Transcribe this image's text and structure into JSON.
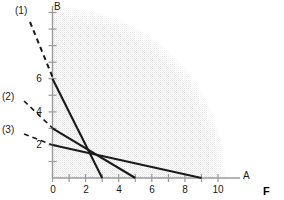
{
  "figure": {
    "title": "",
    "axis_labels": {
      "x": "A",
      "y": "B",
      "corner": "F"
    },
    "origin_px": {
      "x": 52.5,
      "y": 178
    },
    "unit_px": 16.55,
    "axes": {
      "x": {
        "ticks": [
          0,
          1,
          2,
          3,
          4,
          5,
          6,
          7,
          8,
          9,
          10
        ],
        "labeled": [
          0,
          2,
          4,
          6,
          8,
          10
        ],
        "max": 11.2
      },
      "y": {
        "ticks": [
          1,
          2,
          3,
          4,
          5,
          6,
          7,
          8,
          9,
          10
        ],
        "labeled": [
          2,
          4,
          6
        ],
        "max": 10.6
      }
    },
    "lines": [
      {
        "name": "(1)",
        "label": "(1)",
        "y_intercept": 6,
        "x_intercept": 3,
        "label_pos": {
          "x": 22,
          "y": 8
        },
        "leader": {
          "x1": 30,
          "y1": 22,
          "x2": 52,
          "y2": 77
        }
      },
      {
        "name": "(2)",
        "label": "(2)",
        "y_intercept": 3,
        "x_intercept": 5,
        "label_pos": {
          "x": 4,
          "y": 93
        },
        "leader": {
          "x1": 24,
          "y1": 101,
          "x2": 52,
          "y2": 128
        }
      },
      {
        "name": "(3)",
        "label": "(3)",
        "y_intercept": 2,
        "x_intercept": 9,
        "label_pos": {
          "x": 4,
          "y": 126
        },
        "leader": {
          "x1": 24,
          "y1": 134,
          "x2": 52,
          "y2": 145
        }
      }
    ],
    "shaded_region": {
      "type": "quarter-ellipse",
      "semi_x": 10.4,
      "semi_y": 10.3,
      "fill": "#ececec",
      "pattern": "dotted-stipple"
    },
    "colors": {
      "line": "#1a1a1a",
      "axis": "#9a9a9a",
      "text": "#1a1a1a",
      "shade": "#ececec",
      "background": "#ffffff"
    },
    "tick_numbers_x": [
      "0",
      "2",
      "4",
      "6",
      "8",
      "10"
    ],
    "tick_numbers_y": [
      "2",
      "4",
      "6"
    ]
  }
}
